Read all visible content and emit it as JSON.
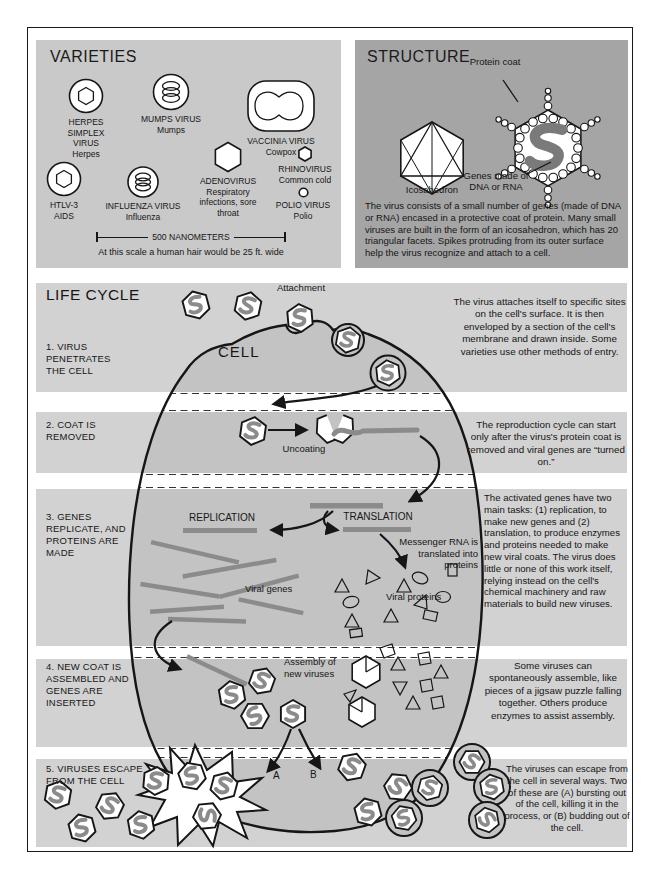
{
  "panels": {
    "varieties": {
      "title": "VARIETIES",
      "items": [
        {
          "name": "HERPES SIMPLEX VIRUS",
          "sub": "Herpes"
        },
        {
          "name": "MUMPS VIRUS",
          "sub": "Mumps"
        },
        {
          "name": "VACCINIA VIRUS",
          "sub": "Cowpox"
        },
        {
          "name": "HTLV-3",
          "sub": "AIDS"
        },
        {
          "name": "INFLUENZA VIRUS",
          "sub": "Influenza"
        },
        {
          "name": "ADENOVIRUS",
          "sub": "Respiratory infections, sore throat"
        },
        {
          "name": "RHINOVIRUS",
          "sub": "Common cold"
        },
        {
          "name": "POLIO VIRUS",
          "sub": "Polio"
        }
      ],
      "scale_label": "500 NANOMETERS",
      "scale_note": "At this scale a human hair would be 25 ft. wide"
    },
    "structure": {
      "title": "STRUCTURE",
      "protein_coat_label": "Protein coat",
      "icosahedron_label": "Icosahedron",
      "genes_label": "Genes made of DNA or RNA",
      "description": "The virus consists of a small number of genes (made of DNA or RNA) encased in a protective coat of protein. Many small viruses are built in the form of an icosahedron, which has 20 triangular facets. Spikes protruding from its outer surface help the virus recognize and attach to a cell."
    }
  },
  "life_cycle": {
    "title": "LIFE CYCLE",
    "cell_label": "CELL",
    "attachment_label": "Attachment",
    "uncoating_label": "Uncoating",
    "replication_label": "REPLICATION",
    "translation_label": "TRANSLATION",
    "mrna_label": "Messenger RNA is translated into proteins",
    "viral_genes_label": "Viral genes",
    "viral_proteins_label": "Viral proteins",
    "assembly_label": "Assembly of new viruses",
    "path_a_label": "A",
    "path_b_label": "B",
    "steps": [
      {
        "label": "1. VIRUS PENETRATES THE CELL",
        "description": "The virus attaches itself to specific sites on the cell's surface. It is then enveloped by a section of the cell's membrane and drawn inside. Some varieties use other methods of entry."
      },
      {
        "label": "2. COAT IS REMOVED",
        "description": "The reproduction cycle can start only after the virus's protein coat is removed and viral genes are “turned on.”"
      },
      {
        "label": "3. GENES REPLICATE, AND PROTEINS ARE MADE",
        "description": "The activated genes have two main tasks: (1) replication, to make new genes and (2) translation, to produce enzymes and proteins needed to make new viral coats. The virus does little or none of this work itself, relying instead on the cell's chemical machinery and raw materials to build new viruses."
      },
      {
        "label": "4. NEW COAT IS ASSEMBLED AND GENES ARE INSERTED",
        "description": "Some viruses can spontaneously assemble, like pieces of a jigsaw puzzle falling together. Others produce enzymes to assist assembly."
      },
      {
        "label": "5. VIRUSES ESCAPE FROM THE CELL",
        "description": "The viruses can escape from the cell in several ways. Two of these are (A) bursting out of the cell, killing it in the process, or (B) budding out of the cell."
      }
    ]
  },
  "colors": {
    "paper": "#ffffff",
    "ink": "#161616",
    "panel_light": "#c9c9c9",
    "panel_dark": "#a5a5a5",
    "band": "#d2d2d2",
    "cell": "#c3c3c3",
    "gene": "#8b8b8b"
  }
}
